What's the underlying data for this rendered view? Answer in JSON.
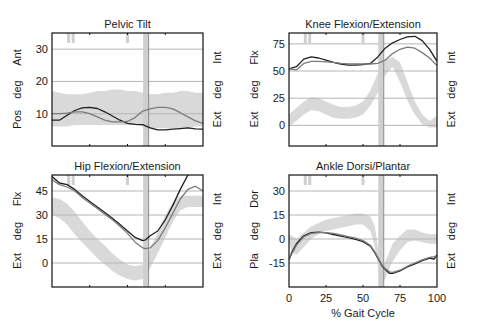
{
  "figure": {
    "x_axis_label": "% Gait Cycle",
    "x_ticks": [
      "0",
      "25",
      "50",
      "75",
      "100"
    ]
  },
  "colors": {
    "normal_band": "#d9d9d9",
    "left_curve": "#1f1f1f",
    "right_curve": "#7a7a7a",
    "grid": "#b5b5b5",
    "event_bar": "#cfcfcf",
    "toe_off_line": "#8a8a8a",
    "frame": "#111111"
  },
  "chart_data": [
    {
      "type": "line",
      "title": "Pelvic Tilt",
      "left_labels": [
        "Pos",
        "deg",
        "Ant"
      ],
      "right_labels": [
        "Ext",
        "deg",
        "Int"
      ],
      "y_ticks": [
        "10",
        "20",
        "30"
      ],
      "ylim": [
        0,
        35
      ],
      "xlim": [
        0,
        100
      ],
      "grid": true,
      "x": [
        0,
        5,
        10,
        15,
        20,
        25,
        30,
        35,
        40,
        45,
        50,
        55,
        60,
        65,
        70,
        75,
        80,
        85,
        90,
        95,
        100
      ],
      "series": [
        {
          "name": "Left",
          "values": [
            8,
            8,
            9.5,
            11,
            11.8,
            12,
            11.6,
            10.6,
            9.3,
            8,
            7,
            6.7,
            6.6,
            5.6,
            5,
            5,
            5.2,
            5.4,
            5.6,
            5.3,
            5.2
          ]
        },
        {
          "name": "Right",
          "values": [
            10,
            10,
            10.2,
            10.6,
            10.6,
            10,
            9,
            8,
            7.5,
            7.5,
            7.6,
            8.8,
            10.8,
            11.5,
            12,
            12,
            11.5,
            10.3,
            9,
            7.8,
            7
          ]
        },
        {
          "name": "Normal band",
          "lower": [
            6,
            6,
            6,
            6.5,
            6.5,
            6.5,
            6.5,
            6.5,
            6.5,
            6.5,
            6.5,
            6.5,
            6,
            5.5,
            5.5,
            5.5,
            5.5,
            5.5,
            5.5,
            6,
            6
          ],
          "upper": [
            17,
            16.5,
            16,
            16,
            16,
            16.5,
            17,
            17,
            17.5,
            17.5,
            17,
            17,
            16.5,
            16,
            16,
            16.5,
            16.5,
            17,
            17,
            16.5,
            16.5
          ]
        }
      ],
      "events": {
        "foot_off_bars": [
          11,
          14,
          50
        ],
        "toe_off_line": 64,
        "toe_off_bar": 61
      }
    },
    {
      "type": "line",
      "title": "Knee Flexion/Extension",
      "left_labels": [
        "Ext",
        "deg",
        "Flx"
      ],
      "right_labels": [
        "Ext",
        "deg",
        "Int"
      ],
      "y_ticks": [
        "0",
        "25",
        "50",
        "75"
      ],
      "ylim": [
        -19,
        85
      ],
      "xlim": [
        0,
        100
      ],
      "grid": true,
      "x": [
        0,
        5,
        10,
        15,
        20,
        25,
        30,
        35,
        40,
        45,
        50,
        55,
        60,
        65,
        70,
        75,
        80,
        85,
        90,
        95,
        100
      ],
      "series": [
        {
          "name": "Left",
          "values": [
            52,
            54,
            61,
            63,
            62,
            60,
            58,
            56.5,
            55.5,
            55.5,
            56,
            57,
            63,
            71,
            76,
            79,
            81.5,
            82,
            78,
            70,
            59
          ]
        },
        {
          "name": "Right",
          "values": [
            52,
            51,
            57,
            59,
            59,
            58.5,
            58,
            57,
            56.5,
            56.5,
            56.5,
            56.5,
            57,
            60,
            66,
            70,
            72,
            71,
            67,
            62,
            55
          ]
        },
        {
          "name": "Normal band",
          "lower": [
            -1,
            4,
            10,
            14,
            13,
            10,
            7,
            6,
            6,
            7,
            10,
            18,
            30,
            46,
            54,
            40,
            23,
            10,
            1,
            -2,
            -2
          ],
          "upper": [
            10,
            16,
            22,
            26,
            25,
            22,
            19,
            17,
            17,
            18,
            22,
            32,
            48,
            60,
            63,
            58,
            40,
            22,
            10,
            4,
            9
          ]
        }
      ],
      "events": {
        "foot_off_bars": [
          11,
          14,
          50
        ],
        "toe_off_line": 64,
        "toe_off_bar": 61
      }
    },
    {
      "type": "line",
      "title": "Hip Flexion/Extension",
      "left_labels": [
        "Ext",
        "deg",
        "Flx"
      ],
      "right_labels": [
        "Ext",
        "deg",
        "Int"
      ],
      "y_ticks": [
        "0",
        "15",
        "30",
        "45"
      ],
      "ylim": [
        -15,
        55
      ],
      "xlim": [
        0,
        100
      ],
      "grid": true,
      "x": [
        0,
        5,
        10,
        15,
        20,
        25,
        30,
        35,
        40,
        45,
        50,
        55,
        60,
        62,
        65,
        70,
        75,
        80,
        85,
        90,
        95,
        100
      ],
      "series": [
        {
          "name": "Left",
          "values": [
            54,
            50,
            49,
            46,
            42,
            38.5,
            35,
            31.5,
            28,
            24,
            20,
            16,
            14,
            14.5,
            17,
            20,
            27,
            36,
            46,
            55,
            62,
            67
          ]
        },
        {
          "name": "Right",
          "values": [
            52,
            49,
            47.5,
            45,
            41,
            37.5,
            34,
            30.5,
            27,
            23,
            18.5,
            13,
            9.5,
            9,
            9.5,
            14,
            22,
            31,
            40,
            46,
            48,
            45
          ]
        },
        {
          "name": "Normal band",
          "lower": [
            30,
            28,
            24,
            18,
            13,
            8,
            3,
            -1,
            -5,
            -8,
            -10,
            -11,
            -10,
            -8,
            -3,
            6,
            16,
            26,
            33,
            35,
            35,
            35
          ],
          "upper": [
            41,
            40,
            37,
            32,
            26,
            20,
            15,
            11,
            6,
            2,
            -1,
            -2,
            -1,
            2,
            9,
            19,
            30,
            38,
            42,
            42,
            42,
            42
          ]
        }
      ],
      "events": {
        "foot_off_bars": [
          11,
          14,
          50
        ],
        "toe_off_line": 64,
        "toe_off_bar": 61
      }
    },
    {
      "type": "line",
      "title": "Ankle Dorsi/Plantar",
      "left_labels": [
        "Pla",
        "deg",
        "Dor"
      ],
      "right_labels": [
        "Ext",
        "deg",
        "Int"
      ],
      "y_ticks": [
        "-15",
        "0",
        "15",
        "30"
      ],
      "ylim": [
        -30,
        40
      ],
      "xlim": [
        0,
        100
      ],
      "grid": true,
      "x": [
        0,
        2,
        5,
        10,
        15,
        20,
        25,
        30,
        35,
        40,
        45,
        50,
        55,
        58,
        60,
        63,
        65,
        68,
        70,
        75,
        80,
        85,
        90,
        95,
        98,
        100
      ],
      "series": [
        {
          "name": "Left",
          "values": [
            -13,
            -8,
            -3,
            2,
            4,
            4.3,
            3.8,
            2.8,
            1.8,
            0.8,
            -0.2,
            -1.6,
            -4.5,
            -8.5,
            -12,
            -17,
            -19,
            -21.5,
            -21.5,
            -20,
            -17.5,
            -15.5,
            -13.5,
            -12,
            -12.5,
            -10
          ]
        },
        {
          "name": "Right",
          "values": [
            -13,
            -9,
            -4,
            1.5,
            3.5,
            4,
            4,
            3.5,
            2.5,
            1.5,
            0.5,
            -1,
            -4,
            -8,
            -11.5,
            -16.5,
            -18.5,
            -20.5,
            -20.8,
            -19.5,
            -17,
            -15,
            -13,
            -11.5,
            -11,
            -10.5
          ]
        },
        {
          "name": "Normal band",
          "lower": [
            -3,
            -8,
            -10,
            -5,
            0,
            3,
            5,
            6,
            7,
            8,
            9,
            9,
            5,
            -5,
            -15,
            -28,
            -25,
            -18,
            -14,
            -7,
            -2,
            -1,
            -2,
            -3,
            -3,
            -3
          ],
          "upper": [
            3,
            2,
            0,
            4,
            8,
            10,
            12,
            13,
            14,
            15,
            16,
            16,
            14,
            8,
            -5,
            -20,
            -14,
            -8,
            -3,
            2,
            6,
            6,
            4,
            3,
            3,
            3
          ]
        }
      ],
      "events": {
        "foot_off_bars": [
          11,
          14,
          50
        ],
        "toe_off_line": 64,
        "toe_off_bar": 61
      }
    }
  ]
}
